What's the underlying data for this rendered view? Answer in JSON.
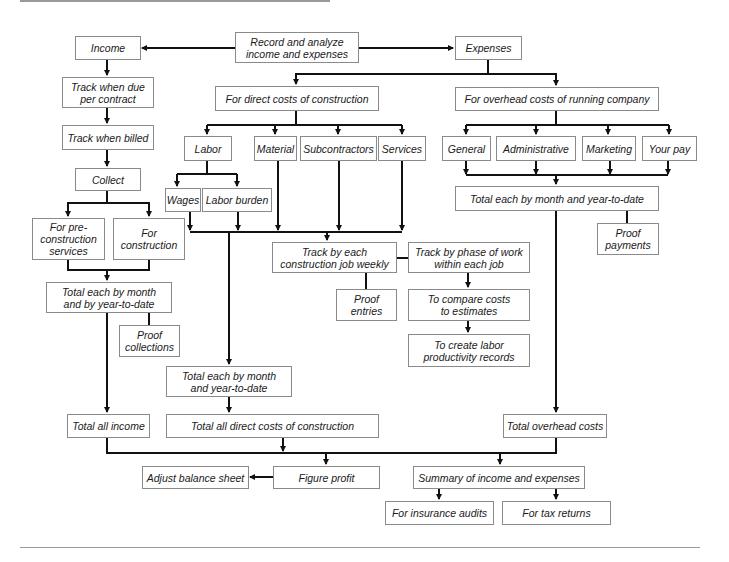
{
  "diagram": {
    "title": "Record and analyze income and expenses",
    "colors": {
      "line": "#111111",
      "box_border": "#8a8a8a",
      "rule": "#9a9a9a",
      "text": "#1a1a1a"
    },
    "nodes": {
      "root": "Record and analyze\nincome and expenses",
      "income": "Income",
      "expenses": "Expenses",
      "track_due": "Track when due\nper contract",
      "track_billed": "Track when billed",
      "collect": "Collect",
      "pre_construction": "For pre-\nconstruction\nservices",
      "for_construction": "For\nconstruction",
      "income_total_each": "Total each by month\nand by year-to-date",
      "proof_collections": "Proof\ncollections",
      "total_all_income": "Total all income",
      "direct_costs": "For direct costs of construction",
      "labor": "Labor",
      "material": "Material",
      "subcontractors": "Subcontractors",
      "services": "Services",
      "wages": "Wages",
      "labor_burden": "Labor burden",
      "track_job_weekly": "Track by each\nconstruction job weekly",
      "proof_entries": "Proof\nentries",
      "track_phase": "Track by phase of work\nwithin each job",
      "compare_costs": "To compare costs\nto estimates",
      "labor_productivity": "To create labor\nproductivity records",
      "direct_total_each": "Total each by month\nand year-to-date",
      "total_direct_costs": "Total all direct costs of construction",
      "overhead_costs": "For overhead costs of running company",
      "general": "General",
      "administrative": "Administrative",
      "marketing": "Marketing",
      "your_pay": "Your pay",
      "overhead_total_each": "Total each by month and year-to-date",
      "proof_payments": "Proof\npayments",
      "total_overhead": "Total overhead costs",
      "adjust_balance": "Adjust balance sheet",
      "figure_profit": "Figure profit",
      "summary": "Summary of income and expenses",
      "insurance_audits": "For insurance audits",
      "tax_returns": "For tax returns"
    }
  }
}
